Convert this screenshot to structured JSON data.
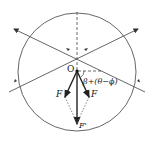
{
  "diagram": {
    "type": "force-vector-diagram",
    "labels": {
      "origin": "O",
      "force_left": "F",
      "force_right": "F",
      "resultant": "F'",
      "angle": "β+(θ−ϕ)"
    },
    "colors": {
      "stroke": "#333333",
      "background": "#ffffff"
    }
  }
}
